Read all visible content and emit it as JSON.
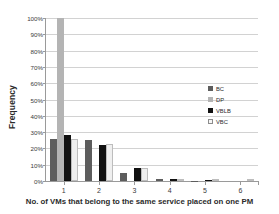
{
  "chart_data": {
    "type": "bar",
    "title": "",
    "xlabel": "No. of VMs that belong to the same service placed on one PM",
    "ylabel": "Frequency",
    "categories": [
      "1",
      "2",
      "3",
      "4",
      "5",
      "6"
    ],
    "ylim": [
      0,
      100
    ],
    "ytick_labels": [
      "0%",
      "10%",
      "20%",
      "30%",
      "40%",
      "50%",
      "60%",
      "70%",
      "80%",
      "90%",
      "100%"
    ],
    "ytick_values": [
      0,
      10,
      20,
      30,
      40,
      50,
      60,
      70,
      80,
      90,
      100
    ],
    "grid": true,
    "legend_position": "right",
    "series": [
      {
        "name": "BC",
        "color": "#5d5d5d",
        "values": [
          26,
          25,
          5,
          1,
          0.3,
          0
        ]
      },
      {
        "name": "DP",
        "color": "#b4b4b4",
        "values": [
          100,
          0,
          0,
          0,
          0,
          0
        ]
      },
      {
        "name": "VBLB",
        "color": "#111111",
        "values": [
          28,
          22,
          8,
          1,
          0.4,
          0
        ]
      },
      {
        "name": "VBC",
        "color": "#efefef",
        "values": [
          26,
          22.5,
          8,
          1.3,
          0.4,
          0
        ]
      }
    ]
  }
}
